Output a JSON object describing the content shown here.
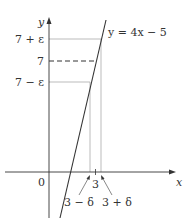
{
  "axes": {
    "x_label": "x",
    "y_label": "y",
    "origin_label": "0"
  },
  "curve": {
    "equation": "y = 4x − 5"
  },
  "y_markers": {
    "upper": "7 + ε",
    "center": "7",
    "lower": "7 − ε"
  },
  "x_markers": {
    "center": "3",
    "left": "3 − δ",
    "right": "3 + δ"
  },
  "colors": {
    "axis": "#333333",
    "guide": "#aaaaaa",
    "curve": "#333333"
  }
}
